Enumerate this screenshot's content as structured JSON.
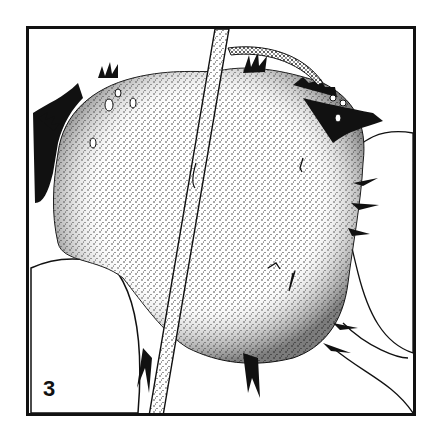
{
  "figure": {
    "panel_number": "3",
    "caption_truncated": "",
    "colors": {
      "ink": "#111111",
      "paper": "#ffffff"
    }
  }
}
